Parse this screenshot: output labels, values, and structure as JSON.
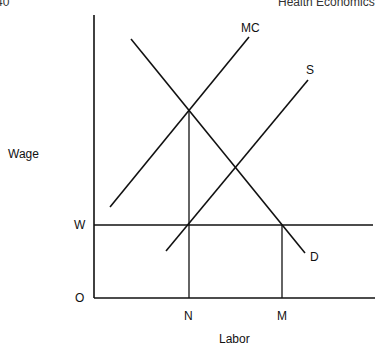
{
  "header": {
    "page_number": "40",
    "running_title": "Health Economics"
  },
  "diagram": {
    "y_axis_label": "Wage",
    "x_axis_label": "Labor",
    "origin_label": "O",
    "wage_level_label": "W",
    "quantity_labels": [
      "N",
      "M"
    ],
    "curves": [
      {
        "name": "MC",
        "label": "MC",
        "kind": "marginal cost",
        "slope": "upward"
      },
      {
        "name": "S",
        "label": "S",
        "kind": "supply",
        "slope": "upward"
      },
      {
        "name": "D",
        "label": "D",
        "kind": "demand",
        "slope": "downward"
      }
    ],
    "guides": [
      {
        "name": "wage-line",
        "description": "horizontal line at wage W"
      },
      {
        "name": "n-line",
        "description": "vertical line at N through MC=D and S=W"
      },
      {
        "name": "m-line",
        "description": "vertical line at M from D=W"
      }
    ]
  }
}
